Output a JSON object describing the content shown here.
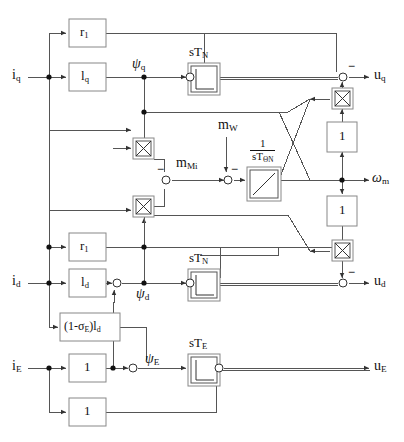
{
  "diagram": {
    "background": "#ffffff",
    "line_color": "#555555",
    "text_color": "#111111"
  },
  "inputs": [
    {
      "id": "iq",
      "label": "i",
      "sub": "q",
      "x": 16,
      "y": 77
    },
    {
      "id": "id",
      "label": "i",
      "sub": "d",
      "x": 16,
      "y": 283
    },
    {
      "id": "iE",
      "label": "i",
      "sub": "E",
      "x": 16,
      "y": 368
    },
    {
      "id": "mW",
      "label": "m",
      "sub": "W",
      "x": 218,
      "y": 127
    }
  ],
  "outputs": [
    {
      "id": "uq",
      "label": "u",
      "sub": "q",
      "x": 372,
      "y": 77
    },
    {
      "id": "wm",
      "label": "ω",
      "sub": "m",
      "x": 372,
      "y": 180
    },
    {
      "id": "ud",
      "label": "u",
      "sub": "d",
      "x": 372,
      "y": 283
    },
    {
      "id": "uE",
      "label": "u",
      "sub": "E",
      "x": 372,
      "y": 368
    }
  ],
  "gain_blocks": [
    {
      "id": "r1-q",
      "label": "r",
      "sub": "1",
      "x": 69,
      "y": 19,
      "w": 37,
      "h": 28
    },
    {
      "id": "lq",
      "label": "l",
      "sub": "q",
      "x": 69,
      "y": 63,
      "w": 37,
      "h": 28
    },
    {
      "id": "r1-d",
      "label": "r",
      "sub": "1",
      "x": 69,
      "y": 233,
      "w": 37,
      "h": 28
    },
    {
      "id": "ld",
      "label": "l",
      "sub": "d",
      "x": 69,
      "y": 269,
      "w": 37,
      "h": 28
    },
    {
      "id": "sigma-ld",
      "label": "(1-σ",
      "sub": "E",
      "label2": ")l",
      "sub2": "d",
      "x": 60,
      "y": 313,
      "w": 60,
      "h": 28
    },
    {
      "id": "one-iE-a",
      "label": "1",
      "sub": "",
      "x": 69,
      "y": 354,
      "w": 37,
      "h": 28
    },
    {
      "id": "one-iE-b",
      "label": "1",
      "sub": "",
      "x": 69,
      "y": 398,
      "w": 37,
      "h": 28
    },
    {
      "id": "one-upper",
      "label": "1",
      "sub": "",
      "x": 327,
      "y": 122,
      "w": 30,
      "h": 30
    },
    {
      "id": "one-lower",
      "label": "1",
      "sub": "",
      "x": 327,
      "y": 196,
      "w": 30,
      "h": 30
    }
  ],
  "dynamic_blocks": [
    {
      "id": "sTN-q",
      "label": "sT",
      "sub": "N",
      "x": 188,
      "y": 63,
      "w": 32,
      "h": 32,
      "symbol": "step"
    },
    {
      "id": "sTN-d",
      "label": "sT",
      "sub": "N",
      "x": 188,
      "y": 269,
      "w": 32,
      "h": 32,
      "symbol": "step"
    },
    {
      "id": "sTE",
      "label": "sT",
      "sub": "E",
      "x": 188,
      "y": 354,
      "w": 32,
      "h": 32,
      "symbol": "step"
    },
    {
      "id": "integrator",
      "num": "1",
      "den": "sT",
      "den_sub": "ΘN",
      "x": 247,
      "y": 167,
      "w": 34,
      "h": 34,
      "symbol": "ramp"
    }
  ],
  "multipliers": [
    {
      "id": "mult-q-top",
      "x": 133,
      "y": 138,
      "size": 21
    },
    {
      "id": "mult-d-lower",
      "x": 133,
      "y": 196,
      "size": 21
    },
    {
      "id": "mult-uq",
      "x": 332,
      "y": 88,
      "size": 21
    },
    {
      "id": "mult-ud",
      "x": 332,
      "y": 240,
      "size": 21
    }
  ],
  "sum_junctions": [
    {
      "id": "sum-uq-TN",
      "x": 186,
      "y": 77,
      "signs": [
        "+",
        "+"
      ]
    },
    {
      "id": "sum-uq",
      "x": 341,
      "y": 77,
      "signs": [
        "+",
        "-"
      ]
    },
    {
      "id": "sum-mMi",
      "x": 164,
      "y": 180,
      "signs": [
        "+",
        "-"
      ]
    },
    {
      "id": "sum-mW",
      "x": 226,
      "y": 180,
      "signs": [
        "+",
        "-"
      ]
    },
    {
      "id": "sum-ud-TN",
      "x": 186,
      "y": 283,
      "signs": [
        "+",
        "+"
      ]
    },
    {
      "id": "sum-ud",
      "x": 341,
      "y": 283,
      "signs": [
        "+",
        "-"
      ]
    },
    {
      "id": "sum-psid",
      "x": 114,
      "y": 283,
      "signs": [
        "+",
        "+"
      ]
    },
    {
      "id": "sum-psiE",
      "x": 130,
      "y": 368,
      "signs": [
        "+",
        "+"
      ]
    },
    {
      "id": "sum-uE",
      "x": 216,
      "y": 368,
      "signs": [
        "+",
        "+"
      ]
    }
  ],
  "signal_labels": [
    {
      "id": "psi-q",
      "text": "ψ",
      "sub": "q",
      "x": 135,
      "y": 64
    },
    {
      "id": "psi-d",
      "text": "ψ",
      "sub": "d",
      "x": 137,
      "y": 288
    },
    {
      "id": "psi-E",
      "text": "ψ",
      "sub": "E",
      "x": 142,
      "y": 355
    },
    {
      "id": "m-Mi",
      "text": "m",
      "sub": "Mi",
      "x": 175,
      "y": 160
    }
  ],
  "minus_signs": [
    {
      "id": "minus-mMi",
      "x": 157,
      "y": 159
    },
    {
      "id": "minus-mW",
      "x": 231,
      "y": 164
    },
    {
      "id": "minus-uq",
      "x": 347,
      "y": 62
    },
    {
      "id": "minus-ud",
      "x": 347,
      "y": 268
    }
  ],
  "junction_dots": [
    {
      "id": "dot-iq-in",
      "x": 49,
      "y": 77
    },
    {
      "id": "dot-psiq",
      "x": 144,
      "y": 77
    },
    {
      "id": "dot-psiq-2",
      "x": 144,
      "y": 112
    },
    {
      "id": "dot-id-in",
      "x": 49,
      "y": 283
    },
    {
      "id": "dot-id-2",
      "x": 49,
      "y": 247
    },
    {
      "id": "dot-psid",
      "x": 144,
      "y": 283
    },
    {
      "id": "dot-iE-in",
      "x": 49,
      "y": 368
    },
    {
      "id": "dot-iE-2",
      "x": 113,
      "y": 368
    },
    {
      "id": "dot-wm",
      "x": 342,
      "y": 180
    }
  ]
}
